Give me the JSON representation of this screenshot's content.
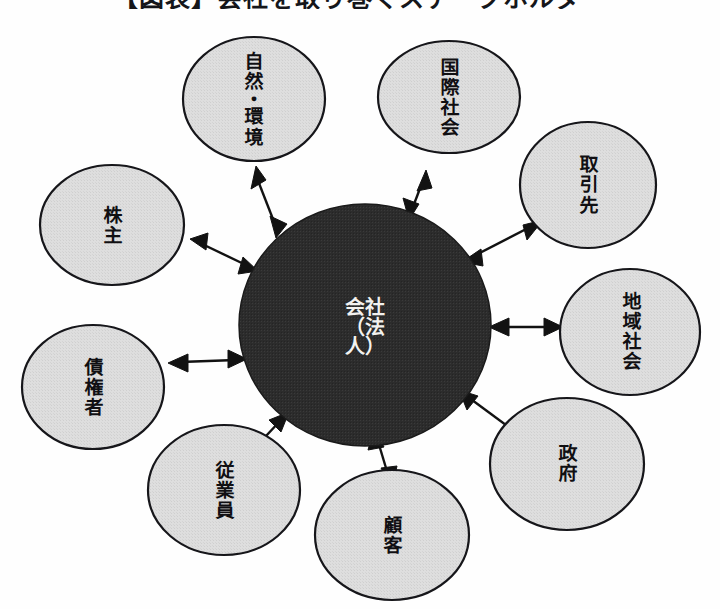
{
  "title": {
    "text": "【図表】会社を取り巻くステークホルダー",
    "note_cropped": true
  },
  "diagram": {
    "type": "hub-and-spoke stakeholder map",
    "center": {
      "id": "company",
      "label_lines": [
        "会社",
        "（法",
        "人）"
      ],
      "label_plain": "会社（法人）",
      "fill": "#2b2b2b",
      "text_color": "#f2f1ef",
      "cx": 365,
      "cy": 325,
      "rx": 126,
      "ry": 121
    },
    "node_style": {
      "fill": "#dcdcdc",
      "stroke": "#1b1b1b",
      "text_color": "#100f12"
    },
    "arrow_style": {
      "color": "#121212",
      "double_headed": true
    },
    "nodes": [
      {
        "id": "nature-environment",
        "label_lines": [
          "自",
          "然",
          "・",
          "環",
          "境"
        ],
        "label_plain": "自然・環境",
        "cx": 254,
        "cy": 99,
        "rx": 71,
        "ry": 62
      },
      {
        "id": "international-society",
        "label_lines": [
          "国",
          "際",
          "社",
          "会"
        ],
        "label_plain": "国際社会",
        "cx": 449,
        "cy": 97,
        "rx": 71,
        "ry": 56
      },
      {
        "id": "business-partners",
        "label_lines": [
          "取",
          "引",
          "先"
        ],
        "label_plain": "取引先",
        "cx": 588,
        "cy": 185,
        "rx": 68,
        "ry": 63
      },
      {
        "id": "local-community",
        "label_lines": [
          "地",
          "域",
          "社",
          "会"
        ],
        "label_plain": "地域社会",
        "cx": 630,
        "cy": 332,
        "rx": 70,
        "ry": 63
      },
      {
        "id": "government",
        "label_lines": [
          "政",
          "府"
        ],
        "label_plain": "政府",
        "cx": 567,
        "cy": 464,
        "rx": 77,
        "ry": 66
      },
      {
        "id": "customers",
        "label_lines": [
          "顧",
          "客"
        ],
        "label_plain": "顧客",
        "cx": 392,
        "cy": 535,
        "rx": 77,
        "ry": 65
      },
      {
        "id": "employees",
        "label_lines": [
          "従",
          "業",
          "員"
        ],
        "label_plain": "従業員",
        "cx": 224,
        "cy": 490,
        "rx": 76,
        "ry": 65
      },
      {
        "id": "creditors",
        "label_lines": [
          "債",
          "権",
          "者"
        ],
        "label_plain": "債権者",
        "cx": 93,
        "cy": 387,
        "rx": 71,
        "ry": 62
      },
      {
        "id": "shareholders",
        "label_lines": [
          "株",
          "主"
        ],
        "label_plain": "株主",
        "cx": 112,
        "cy": 225,
        "rx": 72,
        "ry": 60
      }
    ],
    "connections": [
      {
        "from": "company",
        "to": "nature-environment",
        "double_headed": true
      },
      {
        "from": "company",
        "to": "international-society",
        "double_headed": true
      },
      {
        "from": "company",
        "to": "business-partners",
        "double_headed": true
      },
      {
        "from": "company",
        "to": "local-community",
        "double_headed": true
      },
      {
        "from": "company",
        "to": "government",
        "double_headed": true
      },
      {
        "from": "company",
        "to": "customers",
        "double_headed": true
      },
      {
        "from": "company",
        "to": "employees",
        "double_headed": true
      },
      {
        "from": "company",
        "to": "creditors",
        "double_headed": true
      },
      {
        "from": "company",
        "to": "shareholders",
        "double_headed": true
      }
    ]
  }
}
